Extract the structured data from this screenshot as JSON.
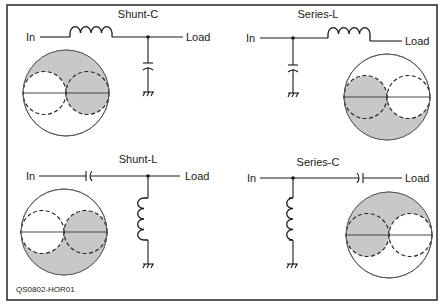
{
  "figure": {
    "id_label": "QS0802-HOR01",
    "colors": {
      "shade": "#c8c8c8",
      "line": "#1a1a1a",
      "frame": "#333333"
    }
  },
  "panels": [
    {
      "title": "Shunt-C",
      "input_label": "In",
      "output_label": "Load",
      "series_element": "inductor",
      "shunt_element": "capacitor",
      "shaded_region": "upper half outside left circle, plus right circle"
    },
    {
      "title": "Series-L",
      "input_label": "In",
      "output_label": "Load",
      "series_element": "inductor",
      "shunt_element": "capacitor",
      "shaded_region": "lower half outside right circle, plus left circle"
    },
    {
      "title": "Shunt-L",
      "input_label": "In",
      "output_label": "Load",
      "series_element": "capacitor",
      "shunt_element": "inductor",
      "shaded_region": "lower half outside left circle, plus right circle"
    },
    {
      "title": "Series-C",
      "input_label": "In",
      "output_label": "Load",
      "series_element": "capacitor",
      "shunt_element": "inductor",
      "shaded_region": "upper half outside right circle, plus left circle"
    }
  ]
}
